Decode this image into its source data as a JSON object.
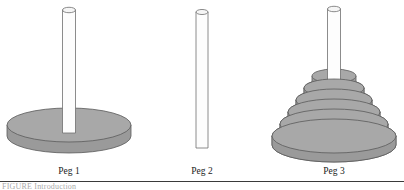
{
  "figure": {
    "caption_text": "FIGURE  Introduction",
    "background_color": "#ffffff",
    "rule_color": "#3a3a3a"
  },
  "palette": {
    "disk_top": "#a8a8a8",
    "disk_side": "#9a9a9a",
    "disk_outline": "#5a5a5a",
    "peg_fill": "#fdfdfd",
    "peg_outline": "#6e6e6e",
    "peg_top": "#f5f5f5",
    "label_color": "#1b1b1b"
  },
  "pegs": [
    {
      "id": "peg-1",
      "label": "Peg 1",
      "label_x": 69,
      "label_y": 166,
      "rod": {
        "cx": 69,
        "top": 10,
        "bottom": 133,
        "width": 13
      },
      "base": {
        "cx": 69,
        "cy": 125,
        "rx": 62,
        "ry": 17,
        "thickness": 11
      },
      "disks": []
    },
    {
      "id": "peg-2",
      "label": "Peg 2",
      "label_x": 202,
      "label_y": 166,
      "rod": {
        "cx": 202,
        "top": 12,
        "bottom": 148,
        "width": 12
      },
      "base": null,
      "disks": []
    },
    {
      "id": "peg-3",
      "label": "Peg 3",
      "label_x": 334,
      "label_y": 166,
      "rod": {
        "cx": 334,
        "top": 9,
        "bottom": 90,
        "width": 13
      },
      "base": null,
      "disks": [
        {
          "n": 1,
          "cx": 334,
          "cy": 76,
          "rx": 22,
          "ry": 7,
          "thickness": 8
        },
        {
          "n": 2,
          "cx": 334,
          "cy": 88,
          "rx": 30,
          "ry": 9,
          "thickness": 8
        },
        {
          "n": 3,
          "cx": 334,
          "cy": 100,
          "rx": 38,
          "ry": 11,
          "thickness": 8
        },
        {
          "n": 4,
          "cx": 334,
          "cy": 112,
          "rx": 46,
          "ry": 13,
          "thickness": 8
        },
        {
          "n": 5,
          "cx": 334,
          "cy": 124,
          "rx": 54,
          "ry": 15,
          "thickness": 8
        },
        {
          "n": 6,
          "cx": 334,
          "cy": 136,
          "rx": 62,
          "ry": 17,
          "thickness": 9
        }
      ]
    }
  ]
}
